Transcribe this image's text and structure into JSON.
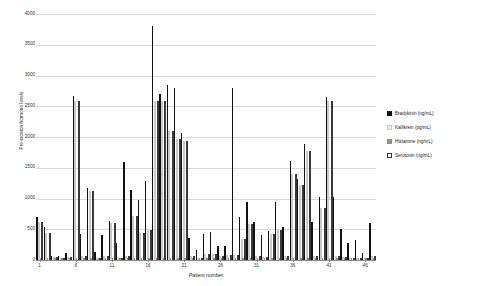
{
  "chart_data": {
    "type": "bar",
    "title": "",
    "xlabel": "Patient number",
    "ylabel": "Pre-incision hormone levels",
    "ylim": [
      0,
      4000
    ],
    "yticks": [
      0,
      500,
      1000,
      1500,
      2000,
      2500,
      3000,
      3500,
      4000
    ],
    "xticks": [
      1,
      6,
      11,
      16,
      21,
      26,
      31,
      36,
      41,
      46
    ],
    "grid": true,
    "legend_position": "right",
    "categories": [
      1,
      2,
      3,
      4,
      5,
      6,
      7,
      8,
      9,
      10,
      11,
      12,
      13,
      14,
      15,
      16,
      17,
      18,
      19,
      20,
      21,
      22,
      23,
      24,
      25,
      26,
      27,
      28,
      29,
      30,
      31,
      32,
      33,
      34,
      35,
      36,
      37,
      38,
      39,
      40,
      41,
      42,
      43,
      44,
      45,
      46,
      47
    ],
    "series": [
      {
        "name": "Bradykinin (ng/mL)",
        "unit": "ng/mL",
        "color": "#111111",
        "values": [
          700,
          530,
          60,
          70,
          110,
          2660,
          430,
          1170,
          130,
          400,
          640,
          280,
          1600,
          1140,
          980,
          1280,
          3800,
          2700,
          2840,
          2790,
          2060,
          360,
          170,
          420,
          450,
          220,
          230,
          2790,
          700,
          940,
          620,
          410,
          470,
          950,
          530,
          1610,
          1310,
          1880,
          620,
          1030,
          2650,
          1030,
          500,
          270,
          330,
          110,
          600
        ]
      },
      {
        "name": "Kallikrein (pg/mL)",
        "unit": "pg/mL",
        "color": "#e2e2e2",
        "values": [
          620,
          440,
          50,
          40,
          50,
          2590,
          60,
          1120,
          40,
          60,
          600,
          40,
          70,
          710,
          440,
          480,
          2590,
          2590,
          2090,
          1960,
          1930,
          60,
          40,
          90,
          90,
          70,
          80,
          80,
          340,
          580,
          60,
          50,
          430,
          480,
          60,
          1400,
          1220,
          1780,
          60,
          850,
          2590,
          60,
          50,
          40,
          40,
          40,
          60
        ]
      },
      {
        "name": "Histamine (ng/mL)",
        "unit": "ng/mL",
        "color": "#8e8e8e",
        "values": [
          30,
          30,
          40,
          40,
          40,
          40,
          30,
          30,
          30,
          30,
          30,
          30,
          30,
          30,
          30,
          30,
          40,
          40,
          40,
          40,
          40,
          30,
          30,
          30,
          30,
          30,
          30,
          30,
          30,
          30,
          30,
          30,
          30,
          30,
          30,
          40,
          40,
          40,
          30,
          30,
          40,
          30,
          30,
          30,
          30,
          30,
          30
        ]
      },
      {
        "name": "Serotonin (ng/mL)",
        "unit": "ng/mL",
        "color": "#ffffff",
        "values": [
          620,
          440,
          50,
          40,
          50,
          2590,
          60,
          1120,
          40,
          60,
          600,
          40,
          70,
          710,
          440,
          480,
          2590,
          2590,
          2090,
          1960,
          1930,
          60,
          40,
          90,
          90,
          70,
          80,
          80,
          340,
          580,
          60,
          50,
          430,
          480,
          60,
          1400,
          1220,
          1780,
          60,
          850,
          2590,
          60,
          50,
          40,
          40,
          40,
          60
        ]
      }
    ]
  },
  "legend": {
    "items": [
      {
        "label": "Bradykinin (ng/mL)",
        "swatch": "brady"
      },
      {
        "label": "Kallikrein (pg/mL)",
        "swatch": "kalli"
      },
      {
        "label": "Histamine (ng/mL)",
        "swatch": "hista"
      },
      {
        "label": "Serotonin (ng/mL)",
        "swatch": "sero"
      }
    ]
  }
}
